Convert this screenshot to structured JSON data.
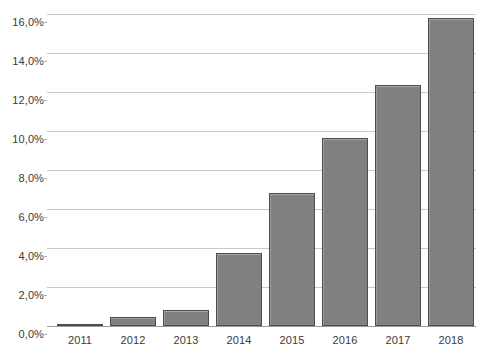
{
  "chart_data": {
    "type": "bar",
    "title": "",
    "subtitle": "",
    "xlabel": "",
    "ylabel": "",
    "categories": [
      "2011",
      "2012",
      "2013",
      "2014",
      "2015",
      "2016",
      "2017",
      "2018"
    ],
    "values": [
      0.1,
      0.45,
      0.8,
      3.75,
      6.8,
      9.65,
      12.35,
      15.8
    ],
    "value_labels": [
      "0,1%",
      "0,45%",
      "0,8%",
      "3,75%",
      "6,8%",
      "9,65%",
      "12,35%",
      "15,8%"
    ],
    "ylim": [
      0,
      16
    ],
    "ytick_values": [
      16,
      14,
      12,
      10,
      8,
      6,
      4,
      2,
      0
    ],
    "ytick_labels": [
      "16,0%",
      "14,0%",
      "12,0%",
      "10,0%",
      "8,0%",
      "6,0%",
      "4,0%",
      "2,0%",
      "0,0%"
    ],
    "grid": true,
    "legend": false,
    "legend_position": "none",
    "series": [
      {
        "name": "",
        "values": [
          0.1,
          0.45,
          0.8,
          3.75,
          6.8,
          9.65,
          12.35,
          15.8
        ]
      }
    ],
    "colors": {
      "bar_fill": "#808080",
      "bar_border": "#4d4d4d",
      "bar_highlight": "#a6a6a6",
      "gridline": "#c8c8c8",
      "axis_line": "#9a9a9a",
      "tick_label": "#3a3a3a",
      "background": "#ffffff"
    }
  }
}
